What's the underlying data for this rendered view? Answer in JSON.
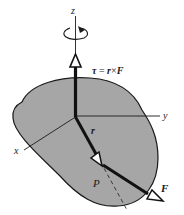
{
  "figure": {
    "labels": {
      "z_axis": "z",
      "y_axis": "y",
      "x_axis": "x",
      "torque_eq_tau": "τ",
      "torque_eq_rest_eq": " = ",
      "torque_eq_r": "r",
      "torque_eq_cross": "×",
      "torque_eq_F": "F",
      "r_vector": "r",
      "F_vector": "F",
      "point_P": "P"
    },
    "colors": {
      "body_fill": "#a6a6a6",
      "outline": "#1a1a1a",
      "background": "#ffffff"
    }
  }
}
